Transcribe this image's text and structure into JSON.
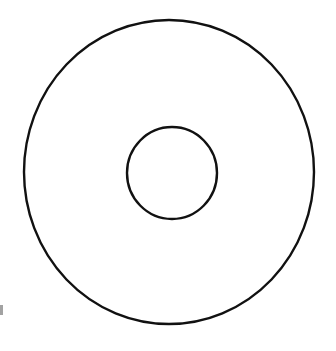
{
  "figure": {
    "kind": "annulus-diagram",
    "title": "Annulus",
    "description": "Two concentric circles forming a ring (annulus)",
    "background_color": "#ffffff",
    "stroke_color": "#111111",
    "canvas": {
      "width": 336,
      "height": 351
    }
  },
  "shapes": {
    "outer_circle": {
      "name": "outer-circle",
      "center_x": 169,
      "center_y": 172,
      "radius_x": 145,
      "radius_y": 152,
      "stroke_width": 2.4,
      "stroke_color": "#111111",
      "fill": "none"
    },
    "inner_circle": {
      "name": "inner-circle",
      "center_x": 172,
      "center_y": 173,
      "radius_x": 45,
      "radius_y": 46,
      "stroke_width": 2.4,
      "stroke_color": "#111111",
      "fill": "none"
    }
  },
  "artifacts": {
    "edge_mark": {
      "name": "scan-edge-mark",
      "x": 0,
      "y": 305,
      "width": 3,
      "height": 10,
      "color": "#555555",
      "opacity": 0.55
    }
  },
  "chart_data": {
    "type": "diagram",
    "title": "Annulus",
    "shapes": [
      "outer-circle",
      "inner-circle"
    ],
    "labels": [],
    "annotations": []
  }
}
